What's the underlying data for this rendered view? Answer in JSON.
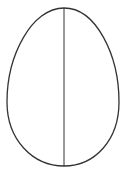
{
  "diagram": {
    "shape": "egg",
    "stroke_color": "#333333",
    "background": "#ffffff",
    "egg": {
      "top": [
        64,
        8
      ],
      "bottom": [
        64,
        166
      ],
      "left_x": 7,
      "right_x": 119,
      "widest_y": 100
    },
    "divider": {
      "x": 64,
      "y1": 8,
      "y2": 166
    }
  }
}
